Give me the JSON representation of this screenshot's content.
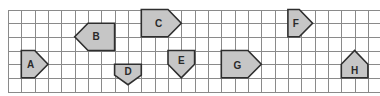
{
  "diagram": {
    "type": "grid-of-pentagons",
    "grid": {
      "origin_x": 8,
      "origin_y": 9.5,
      "cell_w": 13.33,
      "cell_h": 13.67,
      "cols": 28,
      "rows": 6,
      "line_color": "#8a8a8a"
    },
    "colors": {
      "fill": "#c6c6c6",
      "stroke": "#2e2e2e",
      "label": "#2a2a2a"
    },
    "shapes": [
      {
        "label": "A",
        "points": [
          [
            1,
            3
          ],
          [
            2,
            3
          ],
          [
            3,
            4
          ],
          [
            2,
            5
          ],
          [
            1,
            5
          ]
        ],
        "label_at": [
          1.7,
          4
        ]
      },
      {
        "label": "B",
        "points": [
          [
            6,
            1
          ],
          [
            8,
            1
          ],
          [
            8,
            3
          ],
          [
            6,
            3
          ],
          [
            5,
            2
          ]
        ],
        "label_at": [
          6.6,
          2
        ]
      },
      {
        "label": "C",
        "points": [
          [
            10,
            0
          ],
          [
            12,
            0
          ],
          [
            13,
            1
          ],
          [
            12,
            2
          ],
          [
            10,
            2
          ]
        ],
        "label_at": [
          11.3,
          1
        ]
      },
      {
        "label": "D",
        "points": [
          [
            8,
            4
          ],
          [
            10,
            4
          ],
          [
            10,
            4.8
          ],
          [
            9,
            5.5
          ],
          [
            8,
            4.8
          ]
        ],
        "label_at": [
          9,
          4.5
        ]
      },
      {
        "label": "E",
        "points": [
          [
            12,
            3
          ],
          [
            14,
            3
          ],
          [
            14,
            4
          ],
          [
            13,
            5
          ],
          [
            12,
            4
          ]
        ],
        "label_at": [
          13,
          3.75
        ]
      },
      {
        "label": "F",
        "points": [
          [
            21,
            0
          ],
          [
            21.85,
            0
          ],
          [
            22.85,
            1
          ],
          [
            21.85,
            2
          ],
          [
            21,
            2
          ]
        ],
        "label_at": [
          21.6,
          1
        ]
      },
      {
        "label": "G",
        "points": [
          [
            16,
            3
          ],
          [
            18,
            3
          ],
          [
            19,
            4
          ],
          [
            18,
            5
          ],
          [
            16,
            5
          ]
        ],
        "label_at": [
          17.2,
          4.1
        ]
      },
      {
        "label": "H",
        "points": [
          [
            25,
            4
          ],
          [
            26,
            3
          ],
          [
            27,
            4
          ],
          [
            27,
            5
          ],
          [
            25,
            5
          ]
        ],
        "label_at": [
          26,
          4.45
        ]
      }
    ]
  }
}
